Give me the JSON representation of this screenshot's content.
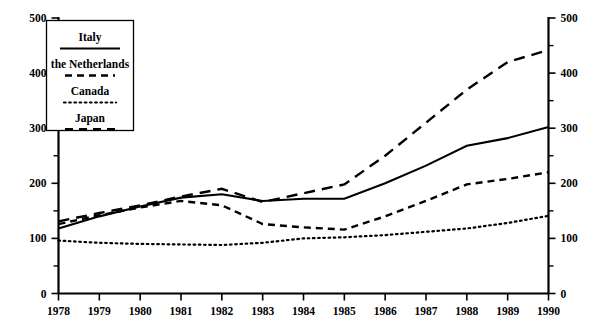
{
  "chart_data": {
    "type": "line",
    "title": "",
    "subtitle": "",
    "xlabel": "",
    "ylabel": "",
    "x": [
      1978,
      1979,
      1980,
      1981,
      1982,
      1983,
      1984,
      1985,
      1986,
      1987,
      1988,
      1989,
      1990
    ],
    "categories": [
      "1978",
      "1979",
      "1980",
      "1981",
      "1982",
      "1983",
      "1984",
      "1985",
      "1986",
      "1987",
      "1988",
      "1989",
      "1990"
    ],
    "xlim": [
      1978,
      1990
    ],
    "ylim": [
      0,
      500
    ],
    "grid": false,
    "legend_position": "top-left",
    "y_ticks_major": [
      0,
      100,
      200,
      300,
      400,
      500
    ],
    "y_ticks_minor": [
      50,
      150,
      250,
      350,
      450
    ],
    "y_tick_labels_left": [
      "0",
      "100",
      "200",
      "300",
      "400",
      "500"
    ],
    "y_tick_labels_right": [
      "0",
      "100",
      "200",
      "300",
      "400",
      "500"
    ],
    "dual_axis": true,
    "series": [
      {
        "name": "Italy",
        "style": "solid",
        "values": [
          118,
          140,
          158,
          174,
          180,
          168,
          172,
          172,
          200,
          232,
          268,
          282,
          302
        ]
      },
      {
        "name": "the Netherlands",
        "style": "long-dash",
        "values": [
          131,
          146,
          160,
          176,
          190,
          166,
          182,
          198,
          250,
          310,
          370,
          420,
          442
        ]
      },
      {
        "name": "Canada",
        "style": "dotted",
        "values": [
          96,
          92,
          90,
          89,
          88,
          92,
          100,
          102,
          106,
          112,
          118,
          128,
          141
        ]
      },
      {
        "name": "Japan",
        "style": "dash",
        "values": [
          126,
          142,
          156,
          168,
          160,
          126,
          120,
          116,
          140,
          168,
          198,
          208,
          220
        ]
      }
    ]
  },
  "legend": {
    "items": [
      {
        "label": "Italy",
        "key": "italy"
      },
      {
        "label": "the Netherlands",
        "key": "netherlands"
      },
      {
        "label": "Canada",
        "key": "canada"
      },
      {
        "label": "Japan",
        "key": "japan"
      }
    ]
  },
  "colors": {
    "ink": "#000000",
    "background": "#ffffff"
  }
}
